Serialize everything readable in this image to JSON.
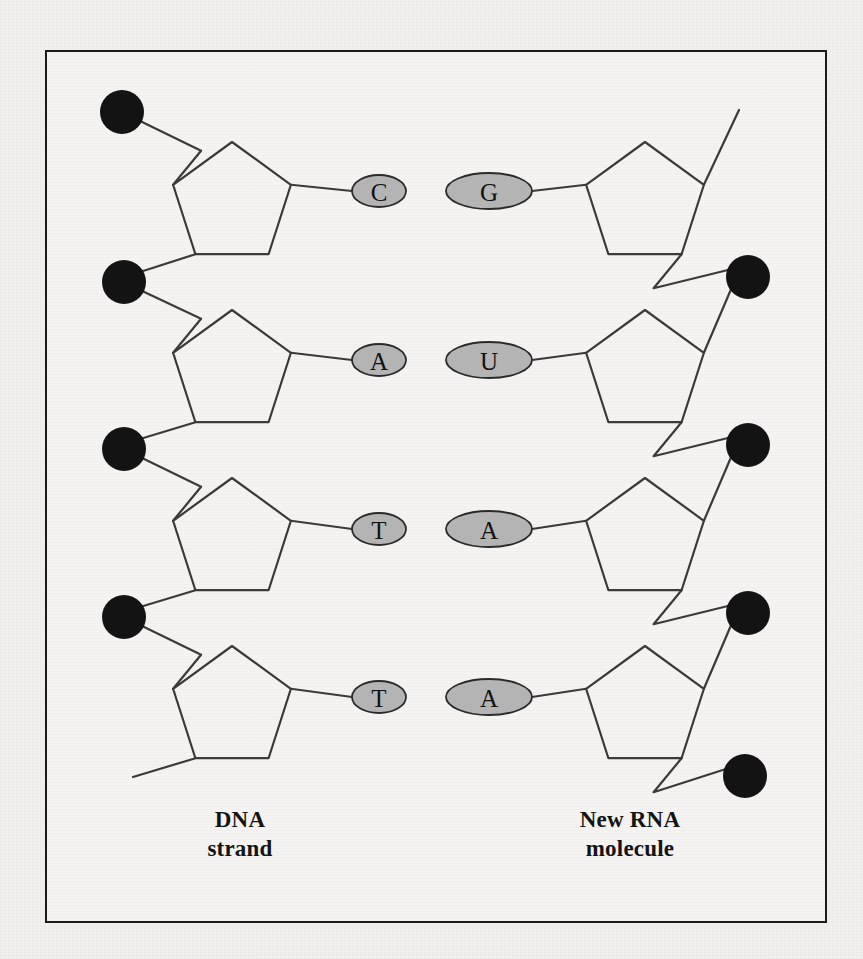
{
  "figure": {
    "frame": {
      "x": 45,
      "y": 50,
      "width": 782,
      "height": 873,
      "border_color": "#1b1b1b"
    },
    "colors": {
      "background": "#f1f0ee",
      "panel": "#f4f3f1",
      "phosphate": "#131313",
      "base_fill": "#b4b4b4",
      "base_stroke": "#2a2a2a",
      "bond_stroke": "#3a3a3a"
    }
  },
  "labels": {
    "dna": "DNA\nstrand",
    "dna_line1": "DNA",
    "dna_line2": "strand",
    "rna": "New RNA\nmolecule",
    "rna_line1": "New RNA",
    "rna_line2": "molecule"
  },
  "chart_data": {
    "type": "diagram",
    "strands": [
      {
        "name": "DNA strand",
        "side": "left",
        "label": "DNA\nstrand",
        "orientation": "phosphates-on-outer-left",
        "sugar_shape": "pentagon",
        "base_ellipse": {
          "rx": 27,
          "ry": 16
        },
        "nucleotides": [
          {
            "index": 1,
            "base": "C",
            "sugar_cx": 232,
            "sugar_cy": 204,
            "base_cx": 379,
            "base_cy": 191
          },
          {
            "index": 2,
            "base": "A",
            "sugar_cx": 232,
            "sugar_cy": 372,
            "base_cx": 379,
            "base_cy": 360
          },
          {
            "index": 3,
            "base": "T",
            "sugar_cx": 232,
            "sugar_cy": 540,
            "base_cx": 379,
            "base_cy": 529
          },
          {
            "index": 4,
            "base": "T",
            "sugar_cx": 232,
            "sugar_cy": 708,
            "base_cx": 379,
            "base_cy": 697
          }
        ],
        "phosphates": [
          {
            "index": 1,
            "cx": 122,
            "cy": 112,
            "r": 22
          },
          {
            "index": 2,
            "cx": 124,
            "cy": 282,
            "r": 22
          },
          {
            "index": 3,
            "cx": 124,
            "cy": 449,
            "r": 22
          },
          {
            "index": 4,
            "cx": 124,
            "cy": 617,
            "r": 22
          }
        ],
        "free_end": {
          "x": 133,
          "y": 777
        }
      },
      {
        "name": "New RNA molecule",
        "side": "right",
        "label": "New RNA\nmolecule",
        "orientation": "phosphates-on-outer-right",
        "sugar_shape": "pentagon-mirrored",
        "base_ellipse": {
          "rx": 43,
          "ry": 18
        },
        "nucleotides": [
          {
            "index": 1,
            "base": "G",
            "sugar_cx": 645,
            "sugar_cy": 204,
            "base_cx": 489,
            "base_cy": 191
          },
          {
            "index": 2,
            "base": "U",
            "sugar_cx": 645,
            "sugar_cy": 372,
            "base_cx": 489,
            "base_cy": 360
          },
          {
            "index": 3,
            "base": "A",
            "sugar_cx": 645,
            "sugar_cy": 540,
            "base_cx": 489,
            "base_cy": 529
          },
          {
            "index": 4,
            "base": "A",
            "sugar_cx": 645,
            "sugar_cy": 708,
            "base_cx": 489,
            "base_cy": 697
          }
        ],
        "phosphates": [
          {
            "index": 1,
            "cx": 748,
            "cy": 277,
            "r": 22
          },
          {
            "index": 2,
            "cx": 748,
            "cy": 445,
            "r": 22
          },
          {
            "index": 3,
            "cx": 748,
            "cy": 613,
            "r": 22
          },
          {
            "index": 4,
            "cx": 745,
            "cy": 776,
            "r": 22
          }
        ],
        "free_end": {
          "x": 739,
          "y": 110
        }
      }
    ],
    "base_pairs": [
      {
        "dna": "C",
        "rna": "G",
        "row": 1
      },
      {
        "dna": "A",
        "rna": "U",
        "row": 2
      },
      {
        "dna": "T",
        "rna": "A",
        "row": 3
      },
      {
        "dna": "T",
        "rna": "A",
        "row": 4
      }
    ]
  }
}
